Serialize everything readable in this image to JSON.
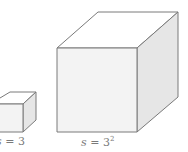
{
  "diagram": {
    "type": "cube-comparison",
    "colors": {
      "edge": "#7a7a7a",
      "front": "#f3f3f3",
      "top": "#ffffff",
      "side": "#e6e6e6",
      "label": "#7a7a7a"
    },
    "cubes": [
      {
        "id": "small",
        "label_var": "s",
        "label_eq": " = ",
        "label_base": "3",
        "label_exp": ""
      },
      {
        "id": "large",
        "label_var": "s",
        "label_eq": " = ",
        "label_base": "3",
        "label_exp": "2"
      }
    ]
  }
}
